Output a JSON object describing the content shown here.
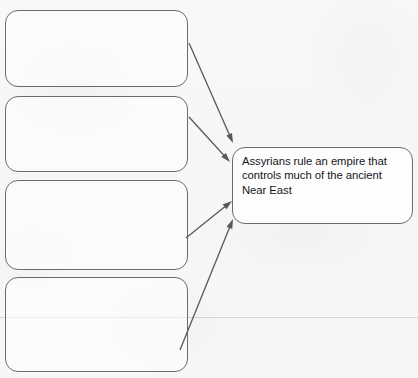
{
  "worksheet": {
    "type": "graphic-organizer",
    "canvas": {
      "width": 418,
      "height": 378,
      "background": "#f7f7f5"
    },
    "line_color": "#6c6c70",
    "arrow_color": "#58585e",
    "text_color": "#16171a"
  },
  "blank_boxes": [
    {
      "id": "blank-box-1",
      "label": "",
      "x": 5,
      "y": 10,
      "w": 183,
      "h": 77
    },
    {
      "id": "blank-box-2",
      "label": "",
      "x": 5,
      "y": 96,
      "w": 183,
      "h": 76
    },
    {
      "id": "blank-box-3",
      "label": "",
      "x": 5,
      "y": 180,
      "w": 183,
      "h": 90
    },
    {
      "id": "blank-box-4",
      "label": "",
      "x": 5,
      "y": 277,
      "w": 183,
      "h": 95
    }
  ],
  "answer_box": {
    "id": "answer-box",
    "text": "Assyrians rule an empire that controls much of the ancient Near East",
    "lines": [
      "Assyrians rule an empire that",
      "controls much of the ancient",
      "Near East"
    ],
    "x": 232,
    "y": 147,
    "w": 181,
    "h": 77
  },
  "arrows": [
    {
      "id": "arrow-from-box-1",
      "from_box": "blank-box-1",
      "to_box": "answer-box",
      "x1": 189,
      "y1": 43,
      "x2": 233,
      "y2": 143
    },
    {
      "id": "arrow-from-box-2",
      "from_box": "blank-box-2",
      "to_box": "answer-box",
      "x1": 189,
      "y1": 117,
      "x2": 230,
      "y2": 162
    },
    {
      "id": "arrow-from-box-3",
      "from_box": "blank-box-3",
      "to_box": "answer-box",
      "x1": 186,
      "y1": 238,
      "x2": 232,
      "y2": 201
    },
    {
      "id": "arrow-from-box-4",
      "from_box": "blank-box-4",
      "to_box": "answer-box",
      "x1": 180,
      "y1": 350,
      "x2": 233,
      "y2": 219
    }
  ],
  "scan_artifacts": {
    "ruled_line_y": 317
  }
}
